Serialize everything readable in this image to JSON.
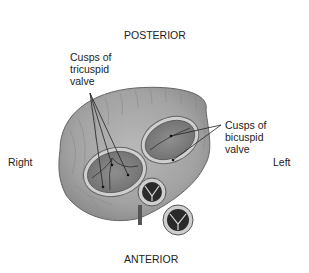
{
  "diagram": {
    "orientation": {
      "top": "POSTERIOR",
      "bottom": "ANTERIOR",
      "left": "Right",
      "right": "Left"
    },
    "labels": {
      "tricuspid": [
        "Cusps of",
        "tricuspid",
        "valve"
      ],
      "bicuspid": [
        "Cusps of",
        "bicuspid",
        "valve"
      ]
    }
  }
}
